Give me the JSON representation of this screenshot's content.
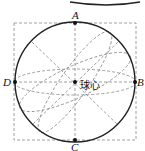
{
  "diagram": {
    "points": {
      "A": "A",
      "B": "B",
      "C": "C",
      "D": "D"
    },
    "center_label": "球心",
    "colors": {
      "stroke": "#222222",
      "dash": "#777777"
    }
  }
}
